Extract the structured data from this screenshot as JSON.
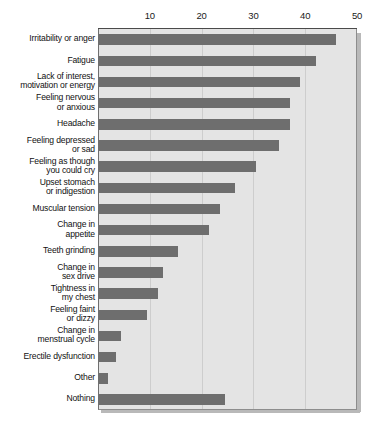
{
  "chart_data": {
    "type": "bar",
    "orientation": "horizontal",
    "title": "",
    "xlabel": "",
    "ylabel": "",
    "xlim": [
      0,
      50
    ],
    "grid": true,
    "legend": "none",
    "axis_position": "top",
    "tick_labels": [
      "10",
      "20",
      "30",
      "40",
      "50"
    ],
    "ticks": [
      10,
      20,
      30,
      40,
      50
    ],
    "categories": [
      "Irritability or anger",
      "Fatigue",
      "Lack of interest,\nmotivation or energy",
      "Feeling nervous\nor anxious",
      "Headache",
      "Feeling depressed\nor sad",
      "Feeling as though\nyou could cry",
      "Upset stomach\nor indigestion",
      "Muscular tension",
      "Change in\nappetite",
      "Teeth grinding",
      "Change in\nsex drive",
      "Tightness in\nmy chest",
      "Feeling faint\nor dizzy",
      "Change in\nmenstrual cycle",
      "Erectile dysfunction",
      "Other",
      "Nothing"
    ],
    "values": [
      46,
      42,
      39,
      37,
      37,
      35,
      30.5,
      26.5,
      23.5,
      21.5,
      15.5,
      12.5,
      11.5,
      9.5,
      4.5,
      3.5,
      2,
      24.5
    ],
    "colors": {
      "bar": "#6e6e6e",
      "plot_background": "#e4e4e4",
      "gridline": "#cdcdcd",
      "axis": "#4a4a4a",
      "text": "#111111"
    }
  }
}
